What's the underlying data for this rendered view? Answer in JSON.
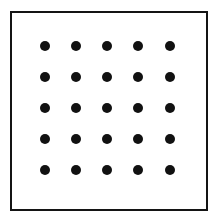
{
  "figure": {
    "title": "",
    "background_color": "#ffffff",
    "frame": {
      "name": "square-outline-frame",
      "stroke_color": "#141414",
      "stroke_width_px": 2.5,
      "fill_color": "#ffffff",
      "left_px": 10,
      "top_px": 11,
      "width_px": 198,
      "height_px": 200
    },
    "dots": {
      "name": "dot-grid",
      "shape": "circle",
      "color": "#111111",
      "diameter_px": 10,
      "rows": 5,
      "columns": 5,
      "count": 25,
      "column_centers_x_px": [
        45,
        76,
        107,
        138,
        170
      ],
      "row_centers_y_px": [
        46,
        77,
        108,
        139,
        170
      ],
      "column_spacing_px": 31,
      "row_spacing_px": 31,
      "points": [
        {
          "row": 1,
          "col": 1,
          "x": 45,
          "y": 46
        },
        {
          "row": 1,
          "col": 2,
          "x": 76,
          "y": 46
        },
        {
          "row": 1,
          "col": 3,
          "x": 107,
          "y": 46
        },
        {
          "row": 1,
          "col": 4,
          "x": 138,
          "y": 46
        },
        {
          "row": 1,
          "col": 5,
          "x": 170,
          "y": 46
        },
        {
          "row": 2,
          "col": 1,
          "x": 45,
          "y": 77
        },
        {
          "row": 2,
          "col": 2,
          "x": 76,
          "y": 77
        },
        {
          "row": 2,
          "col": 3,
          "x": 107,
          "y": 77
        },
        {
          "row": 2,
          "col": 4,
          "x": 138,
          "y": 77
        },
        {
          "row": 2,
          "col": 5,
          "x": 170,
          "y": 77
        },
        {
          "row": 3,
          "col": 1,
          "x": 45,
          "y": 108
        },
        {
          "row": 3,
          "col": 2,
          "x": 76,
          "y": 108
        },
        {
          "row": 3,
          "col": 3,
          "x": 107,
          "y": 108
        },
        {
          "row": 3,
          "col": 4,
          "x": 138,
          "y": 108
        },
        {
          "row": 3,
          "col": 5,
          "x": 170,
          "y": 108
        },
        {
          "row": 4,
          "col": 1,
          "x": 45,
          "y": 139
        },
        {
          "row": 4,
          "col": 2,
          "x": 76,
          "y": 139
        },
        {
          "row": 4,
          "col": 3,
          "x": 107,
          "y": 139
        },
        {
          "row": 4,
          "col": 4,
          "x": 138,
          "y": 139
        },
        {
          "row": 4,
          "col": 5,
          "x": 170,
          "y": 139
        },
        {
          "row": 5,
          "col": 1,
          "x": 45,
          "y": 170
        },
        {
          "row": 5,
          "col": 2,
          "x": 76,
          "y": 170
        },
        {
          "row": 5,
          "col": 3,
          "x": 107,
          "y": 170
        },
        {
          "row": 5,
          "col": 4,
          "x": 138,
          "y": 170
        },
        {
          "row": 5,
          "col": 5,
          "x": 170,
          "y": 170
        }
      ]
    }
  }
}
